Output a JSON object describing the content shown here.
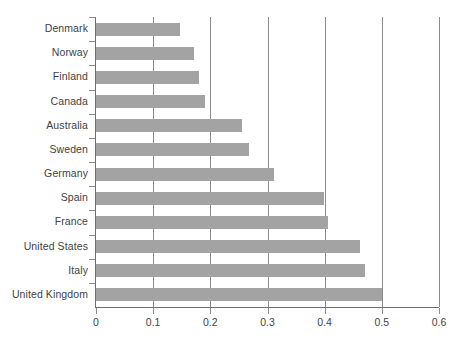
{
  "chart_data": {
    "type": "bar",
    "orientation": "horizontal",
    "title": "",
    "subtitle": "",
    "xlabel": "",
    "ylabel": "",
    "xlim": [
      0,
      0.6
    ],
    "xticks": [
      "0",
      "0.1",
      "0.2",
      "0.3",
      "0.4",
      "0.5",
      "0.6"
    ],
    "xtick_values": [
      0,
      0.1,
      0.2,
      0.3,
      0.4,
      0.5,
      0.6
    ],
    "grid": "vertical",
    "legend": "none",
    "bar_color": "#a3a3a3",
    "axis_color": "#6e6e6e",
    "text_color": "#3f3f3f",
    "categories": [
      "Denmark",
      "Norway",
      "Finland",
      "Canada",
      "Australia",
      "Sweden",
      "Germany",
      "Spain",
      "France",
      "United States",
      "Italy",
      "United Kingdom"
    ],
    "values": [
      0.147,
      0.172,
      0.18,
      0.19,
      0.255,
      0.268,
      0.312,
      0.398,
      0.405,
      0.462,
      0.47,
      0.5
    ]
  }
}
